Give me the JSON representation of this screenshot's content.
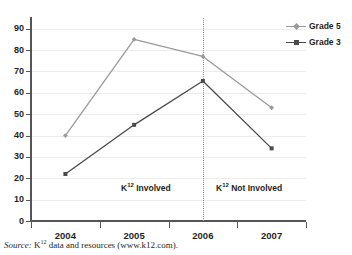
{
  "chart_data": {
    "type": "line",
    "title": "",
    "subtitle": "",
    "xlabel": "",
    "ylabel": "",
    "categories": [
      "2004",
      "2005",
      "2006",
      "2007"
    ],
    "series": [
      {
        "name": "Grade 5",
        "values": [
          40,
          85,
          77,
          53
        ],
        "color": "#9a9a9d",
        "marker": "diamond"
      },
      {
        "name": "Grade 3",
        "values": [
          22,
          45,
          65.5,
          34
        ],
        "color": "#4a4a4d",
        "marker": "square"
      }
    ],
    "ylim": [
      0,
      95
    ],
    "yticks": [
      0,
      10,
      20,
      30,
      40,
      50,
      60,
      70,
      80,
      90
    ],
    "ytick_labels": [
      "0",
      "10",
      "20",
      "30",
      "40",
      "50",
      "60",
      "70",
      "80",
      "90"
    ],
    "grid": true,
    "grid_axis": "y",
    "legend_position": "top-right",
    "annotations": [
      {
        "name": "divider",
        "type": "vline",
        "at_category": "2006",
        "style": "dotted"
      },
      {
        "name": "left-region",
        "type": "text",
        "text_prefix": "K",
        "text_sup": "12",
        "text_suffix": " Involved",
        "x_center_px": 146,
        "y_px": 183
      },
      {
        "name": "right-region",
        "type": "text",
        "text_prefix": "K",
        "text_sup": "12",
        "text_suffix": " Not Involved",
        "x_center_px": 249,
        "y_px": 183
      }
    ]
  },
  "legend": {
    "entries": [
      {
        "label": "Grade 5"
      },
      {
        "label": "Grade 3"
      }
    ]
  },
  "axes": {
    "x_tick_labels": [
      "2004",
      "2005",
      "2006",
      "2007"
    ],
    "y_tick_labels": [
      "90",
      "80",
      "70",
      "60",
      "50",
      "40",
      "30",
      "20",
      "10",
      "0"
    ]
  },
  "annotations": {
    "left_region": {
      "prefix": "K",
      "sup": "12",
      "suffix": " Involved"
    },
    "right_region": {
      "prefix": "K",
      "sup": "12",
      "suffix": " Not Involved"
    }
  },
  "source": {
    "label": "Source:",
    "prefix": " K",
    "sup": "12",
    "suffix": " data and resources (www.k12.com)."
  },
  "colors": {
    "grade5": "#9a9a9d",
    "grade3": "#4a4a4d",
    "axis": "#555558",
    "gridline": "#ededed",
    "divider": "#8d8d90",
    "text": "#1f1f21"
  }
}
